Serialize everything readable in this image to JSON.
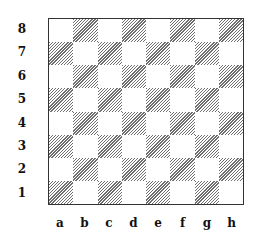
{
  "diagram": {
    "type": "chessboard",
    "ranks": [
      "8",
      "7",
      "6",
      "5",
      "4",
      "3",
      "2",
      "1"
    ],
    "files": [
      "a",
      "b",
      "c",
      "d",
      "e",
      "f",
      "g",
      "h"
    ],
    "dark_square_style": "hatched",
    "colors": {
      "border": "#333333",
      "hatch": "#555555",
      "light": "#ffffff"
    }
  }
}
